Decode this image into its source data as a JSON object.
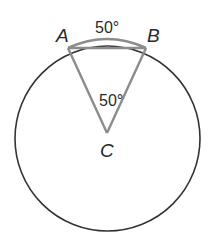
{
  "diagram": {
    "type": "circle-central-angle",
    "colors": {
      "circle": "#333333",
      "triangle": "#8c8c8c",
      "arc": "#8c8c8c",
      "text": "#2a2a2a"
    },
    "points": {
      "A": {
        "label": "A"
      },
      "B": {
        "label": "B"
      },
      "C": {
        "label": "C"
      }
    },
    "labels": {
      "arc_measure": "50°",
      "central_angle": "50°"
    }
  }
}
